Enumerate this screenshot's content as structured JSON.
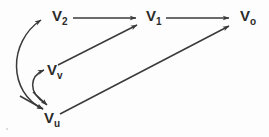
{
  "diagram": {
    "background_color": "#fdfdfd",
    "stroke_color": "#3a3a3a",
    "label_color": "#2b2b2b",
    "nodes": [
      {
        "id": "v2",
        "base": "V",
        "subscript": "2",
        "x": 52,
        "y": 8
      },
      {
        "id": "v1",
        "base": "V",
        "subscript": "1",
        "x": 146,
        "y": 8
      },
      {
        "id": "v0",
        "base": "V",
        "subscript": "o",
        "x": 240,
        "y": 8
      },
      {
        "id": "vv",
        "base": "V",
        "subscript": "v",
        "x": 47,
        "y": 62
      },
      {
        "id": "vu",
        "base": "V",
        "subscript": "u",
        "x": 44,
        "y": 110
      }
    ],
    "edges": [
      {
        "id": "v2-v1",
        "from": "v2",
        "to": "v1",
        "kind": "straight",
        "arrows": "forward"
      },
      {
        "id": "v1-v0",
        "from": "v1",
        "to": "v0",
        "kind": "straight",
        "arrows": "forward"
      },
      {
        "id": "vv-v1",
        "from": "vv",
        "to": "v1",
        "kind": "straight",
        "arrows": "forward"
      },
      {
        "id": "vu-v0",
        "from": "vu",
        "to": "v0",
        "kind": "straight",
        "arrows": "forward"
      },
      {
        "id": "v2-vu",
        "from": "v2",
        "to": "vu",
        "kind": "curved",
        "arrows": "both"
      },
      {
        "id": "vv-vu",
        "from": "vv",
        "to": "vu",
        "kind": "curved",
        "arrows": "both"
      }
    ]
  }
}
